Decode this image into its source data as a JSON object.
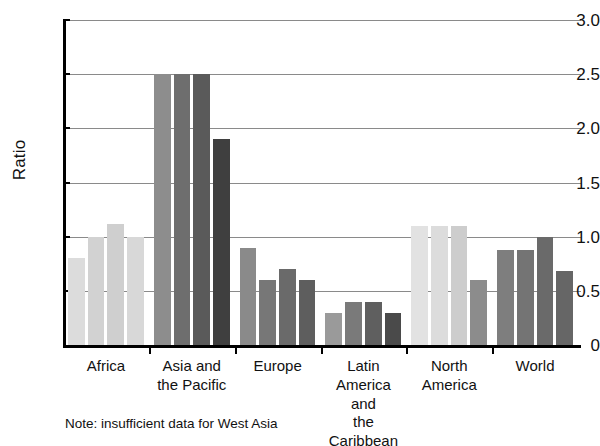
{
  "figure": {
    "title_clipped": "Ratio of female to male enrolment",
    "note": "Note: insufficient data for West Asia"
  },
  "chart_data": {
    "type": "bar",
    "title": "",
    "xlabel": "",
    "ylabel": "Ratio",
    "ylim": [
      0,
      3.0
    ],
    "ytick_labels": [
      "0",
      "0.5",
      "1.0",
      "1.5",
      "2.0",
      "2.5",
      "3.0"
    ],
    "ytick_values": [
      0,
      0.5,
      1.0,
      1.5,
      2.0,
      2.5,
      3.0
    ],
    "grid": true,
    "legend": "none",
    "categories": [
      "Africa",
      "Asia and\nthe Pacific",
      "Europe",
      "Latin America\nand\nthe Caribbean",
      "North\nAmerica",
      "World"
    ],
    "category_labels": [
      [
        "Africa"
      ],
      [
        "Asia and",
        "the Pacific"
      ],
      [
        "Europe"
      ],
      [
        "Latin America",
        "and",
        "the Caribbean"
      ],
      [
        "North",
        "America"
      ],
      [
        "World"
      ]
    ],
    "series": [
      {
        "name": "Series 1",
        "values": [
          0.8,
          2.5,
          0.9,
          0.3,
          1.1,
          0.88
        ],
        "color": "#d3d3d3"
      },
      {
        "name": "Series 2",
        "values": [
          1.0,
          2.5,
          0.6,
          0.4,
          1.1,
          0.88
        ],
        "color": "#b5b5b5"
      },
      {
        "name": "Series 3",
        "values": [
          1.12,
          2.5,
          0.7,
          0.4,
          1.1,
          1.0
        ],
        "color": "#8f8f8f"
      },
      {
        "name": "Series 4",
        "values": [
          1.0,
          1.9,
          0.6,
          0.3,
          0.6,
          0.68
        ],
        "color": "#5e5e5e"
      }
    ],
    "group_colors": [
      [
        "#dcdcdc",
        "#d2d2d2",
        "#cfcfcf",
        "#d8d8d8"
      ],
      [
        "#8d8d8d",
        "#6e6e6e",
        "#5a5a5a",
        "#3f3f3f"
      ],
      [
        "#8a8a8a",
        "#777777",
        "#6a6a6a",
        "#5e5e5e"
      ],
      [
        "#9a9a9a",
        "#7a7a7a",
        "#5f5f5f",
        "#4a4a4a"
      ],
      [
        "#e2e2e2",
        "#dcdcdc",
        "#cdcdcd",
        "#8c8c8c"
      ],
      [
        "#7e7e7e",
        "#747474",
        "#6a6a6a",
        "#666666"
      ]
    ]
  }
}
